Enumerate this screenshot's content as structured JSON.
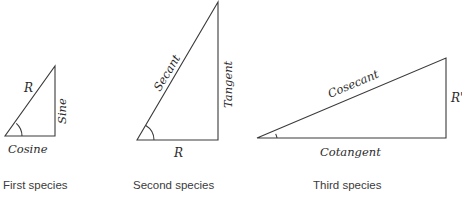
{
  "figure": {
    "background_color": "#ffffff",
    "line_color": "#3a3a3a",
    "text_color": "#2b2b2b",
    "caption_color": "#3b3b3b"
  },
  "triangles": [
    {
      "id": "first-species",
      "caption": "First species",
      "caption_x": 3,
      "caption_y": 189,
      "vertices": {
        "angle_vertex": [
          5,
          136
        ],
        "right_angle_vertex": [
          55,
          136
        ],
        "apex": [
          55,
          66
        ]
      },
      "arc_radius": 17,
      "labels": {
        "hypotenuse": "R",
        "vertical": "Sine",
        "base": "Cosine"
      },
      "label_positions": {
        "hypotenuse": {
          "x": 24,
          "y": 92,
          "rotate": 0
        },
        "vertical": {
          "x": 66,
          "y": 124,
          "rotate": -90
        },
        "base": {
          "x": 8,
          "y": 153,
          "rotate": 0
        }
      }
    },
    {
      "id": "second-species",
      "caption": "Second species",
      "caption_x": 133,
      "caption_y": 189,
      "vertices": {
        "angle_vertex": [
          137,
          140
        ],
        "right_angle_vertex": [
          218,
          140
        ],
        "apex": [
          218,
          2
        ]
      },
      "arc_radius": 17,
      "labels": {
        "hypotenuse": "Secant",
        "vertical": "Tangent",
        "base": "R"
      },
      "label_positions": {
        "hypotenuse": {
          "x": 160,
          "y": 92,
          "rotate": -59
        },
        "vertical": {
          "x": 232,
          "y": 108,
          "rotate": -90
        },
        "base": {
          "x": 174,
          "y": 157,
          "rotate": 0
        }
      }
    },
    {
      "id": "third-species",
      "caption": "Third species",
      "caption_x": 313,
      "caption_y": 189,
      "vertices": {
        "angle_vertex": [
          257,
          138
        ],
        "right_angle_vertex": [
          446,
          138
        ],
        "apex": [
          446,
          58
        ]
      },
      "arc_radius": 20,
      "labels": {
        "hypotenuse": "Cosecant",
        "vertical": "R'",
        "base": "Cotangent"
      },
      "label_positions": {
        "hypotenuse": {
          "x": 330,
          "y": 98,
          "rotate": -23
        },
        "vertical": {
          "x": 451,
          "y": 102,
          "rotate": 0
        },
        "base": {
          "x": 320,
          "y": 156,
          "rotate": 0
        }
      }
    }
  ]
}
